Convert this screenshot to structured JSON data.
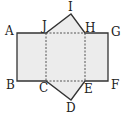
{
  "diagram": {
    "colors": {
      "stroke": "#333333",
      "fill": "#ececec",
      "dashed": "#444444",
      "label": "#222222"
    },
    "points": {
      "A": {
        "label": "A",
        "x": 17,
        "y": 33
      },
      "J": {
        "label": "J",
        "x": 46,
        "y": 33
      },
      "I": {
        "label": "I",
        "x": 71,
        "y": 14
      },
      "H": {
        "label": "H",
        "x": 85,
        "y": 33
      },
      "G": {
        "label": "G",
        "x": 108,
        "y": 33
      },
      "F": {
        "label": "F",
        "x": 108,
        "y": 81
      },
      "E": {
        "label": "E",
        "x": 85,
        "y": 81
      },
      "D": {
        "label": "D",
        "x": 71,
        "y": 100
      },
      "C": {
        "label": "C",
        "x": 46,
        "y": 81
      },
      "B": {
        "label": "B",
        "x": 17,
        "y": 81
      }
    },
    "solid_edges": [
      "A-G",
      "G-F",
      "F-B",
      "B-A",
      "J-I",
      "I-H",
      "C-D",
      "D-E"
    ],
    "dashed_edges": [
      "J-H",
      "C-E",
      "J-C",
      "H-E"
    ]
  }
}
